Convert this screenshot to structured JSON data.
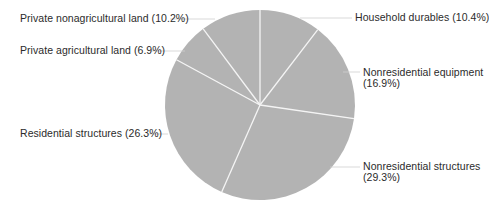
{
  "chart_data": {
    "type": "pie",
    "title": "",
    "start_angle_deg": 0,
    "direction": "clockwise",
    "categories": [
      "Household durables",
      "Nonresidential equipment",
      "Nonresidential structures",
      "Residential structures",
      "Private agricultural land",
      "Private nonagricultural land"
    ],
    "values": [
      10.4,
      16.9,
      29.3,
      26.3,
      6.9,
      10.2
    ],
    "unit": "%",
    "labels": [
      {
        "line1": "Household durables (10.4%)",
        "line2": ""
      },
      {
        "line1": "Nonresidential equipment",
        "line2": "(16.9%)"
      },
      {
        "line1": "Nonresidential structures",
        "line2": "(29.3%)"
      },
      {
        "line1": "Residential structures (26.3%)",
        "line2": ""
      },
      {
        "line1": "Private agricultural land (6.9%)",
        "line2": ""
      },
      {
        "line1": "Private nonagricultural land (10.2%)",
        "line2": ""
      }
    ],
    "legend": "none (leader-line labels)",
    "colors": {
      "slice_fill": "#b3b3b3",
      "slice_separator": "#f4f4f4",
      "leader_line": "#cfcfcf",
      "label_text": "#2b2b2b"
    }
  }
}
